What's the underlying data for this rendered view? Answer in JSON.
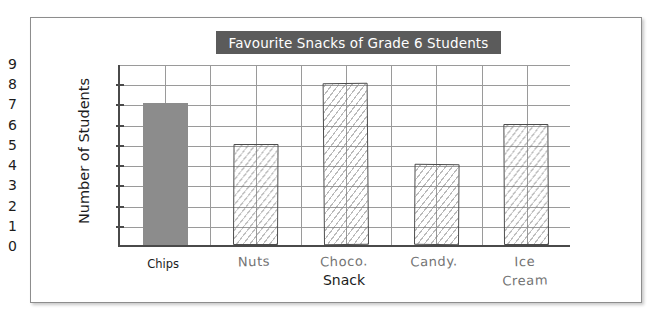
{
  "chart_data": {
    "type": "bar",
    "title": "Favourite Snacks of Grade 6 Students",
    "xlabel": "Snack",
    "ylabel": "Number of Students",
    "categories": [
      "Chips",
      "Nuts",
      "Choco.",
      "Candy.",
      "Ice\nCream"
    ],
    "values": [
      7,
      5,
      8,
      4,
      6
    ],
    "ylim": [
      0,
      9
    ],
    "y_ticks": [
      "0",
      "1",
      "2",
      "3",
      "4",
      "5",
      "6",
      "7",
      "8",
      "9"
    ],
    "grid": true,
    "legend": null,
    "bar_styles": [
      "solid-gray",
      "hand-hatched",
      "hand-hatched",
      "hand-hatched",
      "hand-hatched"
    ],
    "colors": {
      "title_banner_bg": "#5b5b5b",
      "title_text": "#ffffff",
      "solid_bar": "#8c8c8c",
      "sketch_bar_outline": "#4d4d4d",
      "grid_line": "#9a9a9a",
      "axis_line": "#4a4a4a",
      "frame_border": "#8d8d8d",
      "page_background": "#ffffff"
    }
  },
  "figure": {
    "frame_label": "chart-figure-frame"
  }
}
